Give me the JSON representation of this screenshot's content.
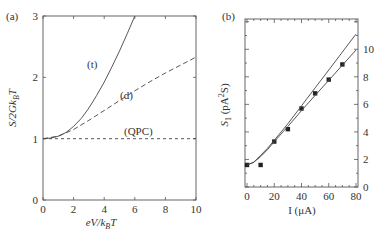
{
  "chart_data": [
    {
      "panel": "(a)",
      "type": "line",
      "xlabel": "eV/k_BT",
      "ylabel": "S/2Gk_BT",
      "xlim": [
        0,
        10
      ],
      "ylim": [
        0,
        3
      ],
      "xticks": [
        0,
        2,
        4,
        6,
        8,
        10
      ],
      "yticks": [
        0,
        1,
        2,
        3
      ],
      "grid": false,
      "series": [
        {
          "name": "(t)",
          "style": "solid",
          "x": [
            0,
            0.5,
            1,
            1.5,
            2,
            2.5,
            3,
            3.5,
            4,
            4.5,
            5,
            5.5,
            6
          ],
          "y": [
            1.0,
            1.01,
            1.04,
            1.1,
            1.2,
            1.33,
            1.5,
            1.7,
            1.92,
            2.17,
            2.43,
            2.71,
            3.0
          ]
        },
        {
          "name": "(d)",
          "style": "dashed",
          "x": [
            0,
            1,
            2,
            3,
            4,
            5,
            6,
            7,
            8,
            9,
            10
          ],
          "y": [
            1.0,
            1.04,
            1.15,
            1.3,
            1.46,
            1.62,
            1.78,
            1.93,
            2.07,
            2.2,
            2.33
          ]
        },
        {
          "name": "(QPC)",
          "style": "dashed",
          "x": [
            0,
            10
          ],
          "y": [
            1.0,
            1.0
          ]
        }
      ],
      "annotations": [
        "(t)",
        "(d)",
        "(QPC)"
      ]
    },
    {
      "panel": "(b)",
      "type": "scatter",
      "xlabel": "I (μA)",
      "ylabel": "S_1 (pA²S)",
      "xlim": [
        0,
        80
      ],
      "ylim": [
        0,
        12.2
      ],
      "xticks": [
        0,
        20,
        40,
        60,
        80
      ],
      "yticks": [
        0,
        2,
        4,
        6,
        8,
        10
      ],
      "yaxis_side": "right",
      "grid": false,
      "series": [
        {
          "name": "data",
          "style": "square-markers",
          "x": [
            0,
            10,
            20,
            30,
            40,
            50,
            60,
            70
          ],
          "y": [
            1.6,
            1.6,
            3.3,
            4.2,
            5.7,
            6.8,
            7.8,
            8.9
          ]
        },
        {
          "name": "fit upper",
          "style": "solid",
          "x": [
            0,
            5,
            10,
            15,
            20,
            30,
            40,
            50,
            60,
            70,
            80
          ],
          "y": [
            1.6,
            1.8,
            2.3,
            2.8,
            3.4,
            4.6,
            5.9,
            7.2,
            8.5,
            9.8,
            11.1
          ]
        },
        {
          "name": "fit lower",
          "style": "solid",
          "x": [
            0,
            5,
            10,
            15,
            20,
            30,
            40,
            50,
            60,
            70,
            80
          ],
          "y": [
            1.6,
            1.8,
            2.2,
            2.7,
            3.3,
            4.4,
            5.55,
            6.65,
            7.75,
            8.85,
            9.95
          ]
        }
      ]
    }
  ],
  "labels": {
    "panel_a": "(a)",
    "panel_b": "(b)",
    "a_xlabel_main": "eV/k",
    "a_xlabel_sub": "B",
    "a_xlabel_tail": "T",
    "a_ylabel_main": "S/2Gk",
    "a_ylabel_sub": "B",
    "a_ylabel_tail": "T",
    "b_xlabel": "I (μA)",
    "b_ylabel_main": "S",
    "b_ylabel_sub": "1",
    "b_ylabel_tail": " (pA",
    "b_ylabel_sup": "2",
    "b_ylabel_end": "S)",
    "curve_t": "(t)",
    "curve_d": "(d)",
    "curve_qpc": "(QPC)"
  }
}
